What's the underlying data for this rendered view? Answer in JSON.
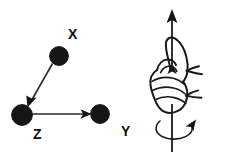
{
  "figure": {
    "background_color": "#ffffff",
    "ink_color": "#151515",
    "panels": [
      {
        "id": "vector-triad",
        "name": "xyz-vector-diagram",
        "labels": [
          {
            "text": "X",
            "x": 68,
            "y": 39
          },
          {
            "text": "Z",
            "x": 33,
            "y": 139
          },
          {
            "text": "Y",
            "x": 121,
            "y": 136
          }
        ],
        "atoms": [
          {
            "name": "atom-x",
            "cx": 59,
            "cy": 56,
            "r": 9.5
          },
          {
            "name": "atom-z",
            "cx": 22,
            "cy": 115,
            "r": 10.5
          },
          {
            "name": "atom-y",
            "cx": 100,
            "cy": 114,
            "r": 9.5
          }
        ],
        "vectors": [
          {
            "name": "vector-x-to-z",
            "x1": 52,
            "y1": 64,
            "x2": 30,
            "y2": 102
          },
          {
            "name": "vector-z-to-y",
            "x1": 32,
            "y1": 114,
            "x2": 89,
            "y2": 114
          }
        ]
      },
      {
        "id": "right-hand-rule",
        "name": "right-hand-rule-illustration",
        "axis": {
          "name": "spin-axis",
          "x": 172,
          "top_y": 10,
          "bottom_y": 152
        },
        "axis_arrow_tip": {
          "x": 172,
          "y": 10
        },
        "rotation_arrow": {
          "cx": 178,
          "cy": 128,
          "rx": 22,
          "ry": 9
        }
      }
    ]
  },
  "caption": {
    "alt": "Left: three filled circles labeled X, Z and Y joined by arrows from X to Z and from Z to Y. Right: a right hand making a fist with the thumb pointing up along a vertical axis arrow, and a curved arrow showing counter-clockwise rotation about that axis."
  }
}
